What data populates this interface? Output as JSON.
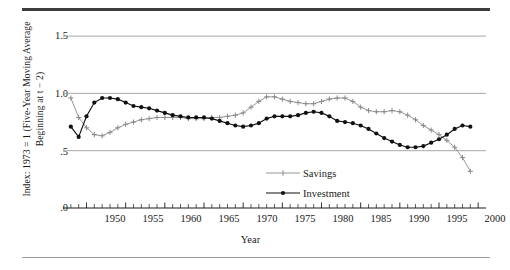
{
  "figure": {
    "xlabel": "Year",
    "ylabel_line1": "Index: 1973 = 1 (Five-Year Moving Average",
    "ylabel_line2": "Beginning at t − 2)",
    "yticks": [
      "1.5",
      "1.0",
      ".5",
      ".0"
    ],
    "xticks": [
      "1950",
      "1955",
      "1960",
      "1965",
      "1970",
      "1975",
      "1980",
      "1985",
      "1990",
      "1995",
      "2000"
    ],
    "legend": [
      {
        "label": "Savings",
        "color": "#8a8a8a",
        "marker": "plus"
      },
      {
        "label": "Investment",
        "color": "#111111",
        "marker": "dot"
      }
    ]
  },
  "chart_data": {
    "type": "line",
    "title": "",
    "xlabel": "Year",
    "ylabel": "Index: 1973 = 1 (Five-Year Moving Average Beginning at t − 2)",
    "xlim": [
      1947,
      2001
    ],
    "ylim": [
      0.0,
      1.6
    ],
    "yticks": [
      1.5,
      1.0,
      0.5,
      0.0
    ],
    "ytick_labels": [
      "1.5",
      "1.0",
      ".5",
      ".0"
    ],
    "xticks": [
      1950,
      1955,
      1960,
      1965,
      1970,
      1975,
      1980,
      1985,
      1990,
      1995,
      2000
    ],
    "minor_xtick_interval": 1,
    "grid": "horizontal",
    "legend_position": "bottom-center",
    "x": [
      1948,
      1949,
      1950,
      1951,
      1952,
      1953,
      1954,
      1955,
      1956,
      1957,
      1958,
      1959,
      1960,
      1961,
      1962,
      1963,
      1964,
      1965,
      1966,
      1967,
      1968,
      1969,
      1970,
      1971,
      1972,
      1973,
      1974,
      1975,
      1976,
      1977,
      1978,
      1979,
      1980,
      1981,
      1982,
      1983,
      1984,
      1985,
      1986,
      1987,
      1988,
      1989,
      1990,
      1991,
      1992,
      1993,
      1994,
      1995,
      1996,
      1997,
      1998,
      1999
    ],
    "series": [
      {
        "name": "Savings",
        "color": "#8a8a8a",
        "marker": "plus",
        "values": [
          0.96,
          0.79,
          0.7,
          0.64,
          0.63,
          0.66,
          0.7,
          0.73,
          0.75,
          0.77,
          0.78,
          0.79,
          0.79,
          0.79,
          0.79,
          0.78,
          0.78,
          0.78,
          0.79,
          0.79,
          0.8,
          0.81,
          0.83,
          0.88,
          0.93,
          0.97,
          0.97,
          0.95,
          0.93,
          0.92,
          0.91,
          0.91,
          0.93,
          0.95,
          0.96,
          0.96,
          0.93,
          0.88,
          0.85,
          0.84,
          0.84,
          0.85,
          0.84,
          0.81,
          0.77,
          0.72,
          0.68,
          0.64,
          0.59,
          0.53,
          0.44,
          0.32
        ]
      },
      {
        "name": "Investment",
        "color": "#111111",
        "marker": "dot",
        "values": [
          0.71,
          0.62,
          0.8,
          0.92,
          0.96,
          0.96,
          0.95,
          0.92,
          0.89,
          0.88,
          0.87,
          0.85,
          0.83,
          0.81,
          0.8,
          0.79,
          0.79,
          0.79,
          0.78,
          0.76,
          0.74,
          0.72,
          0.71,
          0.72,
          0.74,
          0.78,
          0.8,
          0.8,
          0.8,
          0.81,
          0.83,
          0.84,
          0.83,
          0.8,
          0.76,
          0.75,
          0.74,
          0.72,
          0.69,
          0.65,
          0.61,
          0.58,
          0.55,
          0.53,
          0.53,
          0.54,
          0.57,
          0.6,
          0.64,
          0.69,
          0.72,
          0.71
        ]
      }
    ]
  }
}
